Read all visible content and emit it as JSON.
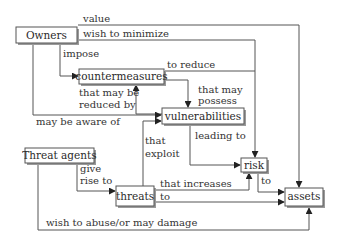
{
  "diagram": {
    "nodes": {
      "owners": "Owners",
      "countermeasures": "countermeasures",
      "vulnerabilities": "vulnerabilities",
      "threat_agents": "Threat agents",
      "threats": "threats",
      "risk": "risk",
      "assets": "assets"
    },
    "edges": {
      "value": "value",
      "wish_to_minimize": "wish to minimize",
      "impose": "impose",
      "to_reduce": "to reduce",
      "that_may_possess_1": "that may",
      "that_may_possess_2": "possess",
      "that_may_be_reduced_by_1": "that may be",
      "that_may_be_reduced_by_2": "reduced by",
      "may_be_aware_of": "may be aware of",
      "leading_to": "leading to",
      "that_exploit_1": "that",
      "that_exploit_2": "exploit",
      "give_rise_to_1": "give",
      "give_rise_to_2": "rise to",
      "that_increases": "that increases",
      "to_assets": "to",
      "risk_to": "to",
      "wish_to_abuse": "wish to abuse/or may damage"
    },
    "colors": {
      "stroke": "#555555",
      "text": "#2a2a2a",
      "background": "#ffffff"
    }
  }
}
